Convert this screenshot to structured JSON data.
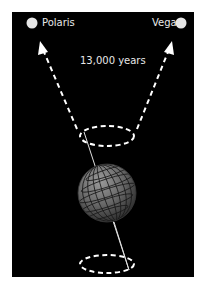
{
  "diagram": {
    "stars": [
      {
        "name": "Polaris",
        "side": "left"
      },
      {
        "name": "Vega",
        "side": "right"
      }
    ],
    "period_label": "13,000 years",
    "colors": {
      "background": "#000000",
      "frame": "#ffffff",
      "lines": "#ffffff",
      "text": "#e8e8e8",
      "globe": "#6e6e6e"
    }
  }
}
